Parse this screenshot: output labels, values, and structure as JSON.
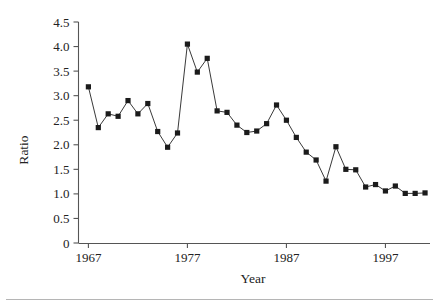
{
  "figure": {
    "name": "ratio-by-year-line-chart",
    "background": "#ffffff",
    "marker_color": "#1b1b1b",
    "axis_color": "#555555",
    "rule_color": "#b5b5b5"
  },
  "axis": {
    "y_title": "Ratio",
    "x_title": "Year",
    "y_ticks": [
      "0",
      "0.5",
      "1.0",
      "1.5",
      "2.0",
      "2.5",
      "3.0",
      "3.5",
      "4.0",
      "4.5"
    ],
    "x_ticks": [
      "1967",
      "1977",
      "1987",
      "1997"
    ]
  },
  "chart_data": {
    "type": "line",
    "title": "",
    "xlabel": "Year",
    "ylabel": "Ratio",
    "xlim": [
      1966,
      2001.5
    ],
    "ylim": [
      0,
      4.5
    ],
    "grid": false,
    "legend": "none",
    "marker": "filled-square",
    "x": [
      1967,
      1968,
      1969,
      1970,
      1971,
      1972,
      1973,
      1974,
      1975,
      1976,
      1977,
      1978,
      1979,
      1980,
      1981,
      1982,
      1983,
      1984,
      1985,
      1986,
      1987,
      1988,
      1989,
      1990,
      1991,
      1992,
      1993,
      1994,
      1995,
      1996,
      1997,
      1998,
      1999,
      2000,
      2001
    ],
    "y": [
      3.18,
      2.35,
      2.63,
      2.58,
      2.9,
      2.63,
      2.84,
      2.27,
      1.95,
      2.24,
      4.05,
      3.48,
      3.76,
      2.69,
      2.66,
      2.4,
      2.25,
      2.28,
      2.43,
      2.81,
      2.5,
      2.15,
      1.85,
      1.69,
      1.26,
      1.96,
      1.5,
      1.49,
      1.14,
      1.19,
      1.06,
      1.16,
      1.01,
      1.01,
      1.02
    ],
    "y_tick_values": [
      0,
      0.5,
      1.0,
      1.5,
      2.0,
      2.5,
      3.0,
      3.5,
      4.0,
      4.5
    ],
    "x_tick_values": [
      1967,
      1977,
      1987,
      1997
    ],
    "series": [
      {
        "name": "Ratio",
        "values": [
          3.18,
          2.35,
          2.63,
          2.58,
          2.9,
          2.63,
          2.84,
          2.27,
          1.95,
          2.24,
          4.05,
          3.48,
          3.76,
          2.69,
          2.66,
          2.4,
          2.25,
          2.28,
          2.43,
          2.81,
          2.5,
          2.15,
          1.85,
          1.69,
          1.26,
          1.96,
          1.5,
          1.49,
          1.14,
          1.19,
          1.06,
          1.16,
          1.01,
          1.01,
          1.02
        ]
      }
    ]
  }
}
